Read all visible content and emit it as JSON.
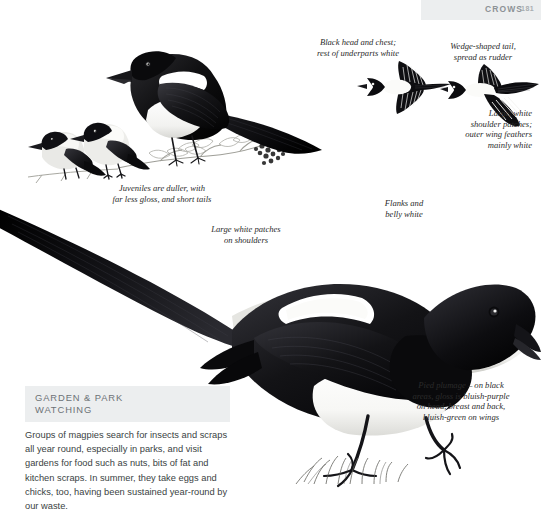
{
  "header": {
    "section_title": "CROWS",
    "page_number": "181",
    "band_color": "#eceeef"
  },
  "captions": [
    {
      "id": "black-head-chest",
      "text": "Black head and chest;\nrest of underparts white"
    },
    {
      "id": "wedge-tail",
      "text": "Wedge-shaped tail,\nspread as rudder"
    },
    {
      "id": "shoulder-patches",
      "text": "Large, white\nshoulder patches;\nouter wing feathers\nmainly white"
    },
    {
      "id": "juveniles",
      "text": "Juveniles are duller, with\nfar less gloss, and short tails"
    },
    {
      "id": "white-patches",
      "text": "Large white patches\non shoulders"
    },
    {
      "id": "flanks-belly",
      "text": "Flanks and\nbelly white"
    },
    {
      "id": "pied-plumage",
      "text": "Pied plumage – on black\nareas, gloss is bluish-purple\non head, breast and back,\nbluish-green on wings"
    }
  ],
  "infobox": {
    "heading": "GARDEN & PARK\nWATCHING",
    "body": "Groups of magpies search for insects and scraps all year round, especially in parks, and visit gardens for food such as nuts, bits of fat and kitchen scraps. In summer, they take eggs and chicks, too, having been sustained year-round by our waste."
  },
  "illustrations": [
    {
      "id": "perched-adult-magpie",
      "label": "Adult magpie perched on berry branch"
    },
    {
      "id": "juvenile-magpies",
      "label": "Two juvenile magpies on branch"
    },
    {
      "id": "flying-magpie-left",
      "label": "Magpie in flight, wings spread"
    },
    {
      "id": "flying-magpie-right",
      "label": "Magpie in flight, tail fanned"
    },
    {
      "id": "main-magpie",
      "label": "Large magpie standing on grass"
    }
  ],
  "colors": {
    "plumage_black": "#111111",
    "plumage_white": "#ffffff",
    "text": "#2b2b2b",
    "band": "#eceeef"
  }
}
